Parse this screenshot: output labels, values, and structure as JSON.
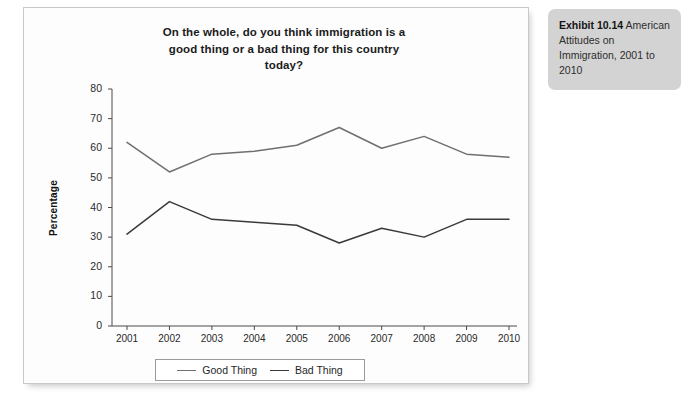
{
  "figure": {
    "title_lines": [
      "On the whole, do you think immigration is a",
      "good thing or a bad thing for this country",
      "today?"
    ],
    "title_full": "On the whole, do you think immigration is a good thing or a bad thing for this country today?"
  },
  "caption": {
    "exhibit_number": "Exhibit 10.14",
    "text": " American Attitudes on Immigration, 2001 to 2010"
  },
  "legend": {
    "good_label": "Good Thing",
    "bad_label": "Bad Thing"
  },
  "colors": {
    "good_line": "#6f6f6f",
    "bad_line": "#3a3a3a",
    "axis": "#4a4a4a",
    "panel_bg": "#fdfdfd",
    "panel_border": "#c9c9c9",
    "caption_bg": "#d3d3d3",
    "page_bg": "#ffffff"
  },
  "chart_data": {
    "type": "line",
    "title": "On the whole, do you think immigration is a good thing or a bad thing for this country today?",
    "xlabel": "",
    "ylabel": "Percentage",
    "categories": [
      "2001",
      "2002",
      "2003",
      "2004",
      "2005",
      "2006",
      "2007",
      "2008",
      "2009",
      "2010"
    ],
    "x": [
      2001,
      2002,
      2003,
      2004,
      2005,
      2006,
      2007,
      2008,
      2009,
      2010
    ],
    "series": [
      {
        "name": "Good Thing",
        "values": [
          62,
          52,
          58,
          59,
          61,
          67,
          60,
          64,
          58,
          57
        ],
        "color": "#6f6f6f"
      },
      {
        "name": "Bad Thing",
        "values": [
          31,
          42,
          36,
          35,
          34,
          28,
          33,
          30,
          36,
          36
        ],
        "color": "#3a3a3a"
      }
    ],
    "ylim": [
      0,
      80
    ],
    "yticks": [
      0,
      10,
      20,
      30,
      40,
      50,
      60,
      70,
      80
    ],
    "ytick_labels": [
      "0",
      "10",
      "20",
      "30",
      "40",
      "50",
      "60",
      "70",
      "80"
    ],
    "grid": false,
    "legend_position": "bottom",
    "markers": false
  }
}
